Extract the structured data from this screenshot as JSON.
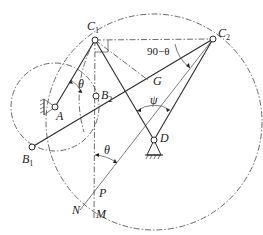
{
  "figure": {
    "type": "four-bar linkage kinematic diagram",
    "points": {
      "C1": {
        "label": "C",
        "sub": "1",
        "x": 95,
        "y": 40
      },
      "C2": {
        "label": "C",
        "sub": "2",
        "x": 213,
        "y": 39
      },
      "A": {
        "label": "A",
        "x": 55,
        "y": 107
      },
      "B1": {
        "label": "B",
        "sub": "1",
        "x": 32,
        "y": 147
      },
      "B2": {
        "label": "B",
        "sub": "2",
        "x": 96,
        "y": 96
      },
      "D": {
        "label": "D",
        "x": 154,
        "y": 140
      },
      "G": {
        "label": "G",
        "x": 151,
        "y": 82
      },
      "P": {
        "label": "P",
        "x": 93,
        "y": 194
      },
      "N": {
        "label": "N"
      },
      "M": {
        "label": "M"
      }
    },
    "angles": {
      "theta_at_A": "θ",
      "theta_at_P": "θ",
      "psi": "ψ",
      "complement": "90−θ"
    }
  }
}
